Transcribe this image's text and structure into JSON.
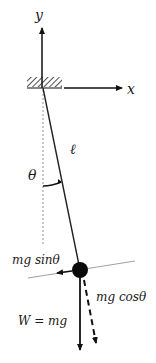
{
  "diagram": {
    "axes": {
      "y_label": "y",
      "x_label": "x"
    },
    "string_label": "ℓ",
    "angle_label": "θ",
    "forces": {
      "tangential": "mg sinθ",
      "radial": "mg cosθ",
      "weight": "W = mg"
    },
    "colors": {
      "ink": "#111111",
      "guide": "#888888",
      "hatch": "#222222"
    }
  }
}
